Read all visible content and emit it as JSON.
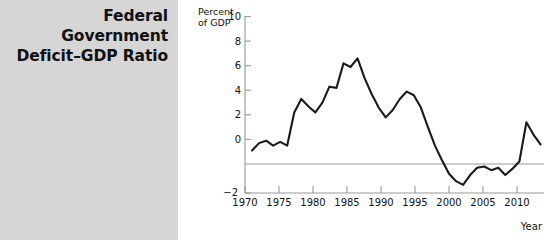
{
  "figure": {
    "title_lines": [
      "Federal",
      "Government",
      "Deficit–GDP Ratio"
    ],
    "panel_color": "#d6d6d6",
    "line_color": "#1a1a1a",
    "axis_color": "#9a9a9a"
  },
  "chart_data": {
    "type": "line",
    "title": "Federal Government Deficit–GDP Ratio",
    "xlabel": "Year",
    "ylabel": "Percent of GDP",
    "ylabel_lines": [
      "Percent",
      "of GDP"
    ],
    "xlim": [
      1969,
      2011.5
    ],
    "ylim": [
      -2,
      10
    ],
    "yticks": [
      -2,
      0,
      2,
      4,
      6,
      8,
      10
    ],
    "ytick_labels": [
      "−2",
      "0",
      "2",
      "4",
      "6",
      "8",
      "10"
    ],
    "xticks": [
      1970,
      1975,
      1980,
      1985,
      1990,
      1995,
      2000,
      2005,
      2010
    ],
    "xtick_labels": [
      "1970",
      "1975",
      "1980",
      "1985",
      "1990",
      "1995",
      "2000",
      "2005",
      "2010"
    ],
    "grid": false,
    "zero_line": true,
    "legend": null,
    "series": [
      {
        "name": "Federal deficit as percent of GDP",
        "x": [
          1970,
          1971,
          1972,
          1973,
          1974,
          1975,
          1976,
          1977,
          1978,
          1979,
          1980,
          1981,
          1982,
          1983,
          1984,
          1985,
          1986,
          1987,
          1988,
          1989,
          1990,
          1991,
          1992,
          1993,
          1994,
          1995,
          1996,
          1997,
          1998,
          1999,
          2000,
          2001,
          2002,
          2003,
          2004,
          2005,
          2006,
          2007,
          2008,
          2009,
          2010,
          2011
        ],
        "values": [
          1.1,
          1.7,
          1.9,
          1.5,
          1.8,
          1.5,
          4.2,
          5.3,
          4.7,
          4.2,
          5.0,
          6.3,
          6.2,
          8.2,
          7.9,
          8.6,
          7.0,
          5.7,
          4.6,
          3.8,
          4.4,
          5.3,
          5.9,
          5.6,
          4.6,
          3.0,
          1.5,
          0.3,
          -0.8,
          -1.4,
          -1.7,
          -0.9,
          -0.3,
          -0.2,
          -0.5,
          -0.3,
          -0.9,
          -0.4,
          0.2,
          3.4,
          2.4,
          1.6
        ]
      }
    ]
  }
}
